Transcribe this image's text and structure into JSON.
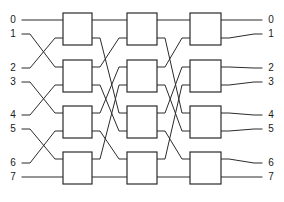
{
  "figure": {
    "type": "diagram",
    "background_color": "#ffffff",
    "line_color": "#2b2b2b",
    "box_fill_color": "#ffffff",
    "label_color": "#1a1a1a"
  },
  "inputs": {
    "labels": [
      "0",
      "1",
      "2",
      "3",
      "4",
      "5",
      "6",
      "7"
    ],
    "label_x": 13,
    "y": [
      20,
      34,
      68,
      82,
      115,
      129,
      163,
      177
    ]
  },
  "outputs": {
    "labels": [
      "0",
      "1",
      "2",
      "3",
      "4",
      "5",
      "6",
      "7"
    ],
    "label_x": 271,
    "y": [
      20,
      34,
      68,
      82,
      115,
      129,
      163,
      177
    ]
  },
  "stages": [
    {
      "name": "stage-1",
      "x": 63,
      "width": 29,
      "boxes": [
        {
          "name": "switch-1-1",
          "y": 13,
          "height": 32
        },
        {
          "name": "switch-1-2",
          "y": 60,
          "height": 32
        },
        {
          "name": "switch-1-3",
          "y": 106,
          "height": 32
        },
        {
          "name": "switch-1-4",
          "y": 152,
          "height": 32
        }
      ]
    },
    {
      "name": "stage-2",
      "x": 127,
      "width": 30,
      "boxes": [
        {
          "name": "switch-2-1",
          "y": 13,
          "height": 32
        },
        {
          "name": "switch-2-2",
          "y": 60,
          "height": 32
        },
        {
          "name": "switch-2-3",
          "y": 106,
          "height": 32
        },
        {
          "name": "switch-2-4",
          "y": 152,
          "height": 32
        }
      ]
    },
    {
      "name": "stage-3",
      "x": 190,
      "width": 31,
      "boxes": [
        {
          "name": "switch-3-1",
          "y": 13,
          "height": 32
        },
        {
          "name": "switch-3-2",
          "y": 60,
          "height": 32
        },
        {
          "name": "switch-3-3",
          "y": 106,
          "height": 32
        },
        {
          "name": "switch-3-4",
          "y": 152,
          "height": 32
        }
      ]
    }
  ],
  "geometry": {
    "port_offsets": [
      7,
      25
    ],
    "input_line_start_x": 22,
    "output_line_end_x": 262
  },
  "wiring": {
    "input_to_stage1": [
      {
        "from": 0,
        "to_box": 0,
        "to_port": 0
      },
      {
        "from": 1,
        "to_box": 1,
        "to_port": 0
      },
      {
        "from": 2,
        "to_box": 0,
        "to_port": 1
      },
      {
        "from": 3,
        "to_box": 2,
        "to_port": 0
      },
      {
        "from": 4,
        "to_box": 1,
        "to_port": 1
      },
      {
        "from": 5,
        "to_box": 3,
        "to_port": 0
      },
      {
        "from": 6,
        "to_box": 2,
        "to_port": 1
      },
      {
        "from": 7,
        "to_box": 3,
        "to_port": 1
      }
    ],
    "stage1_to_stage2": [
      {
        "from_box": 0,
        "from_port": 0,
        "to_box": 0,
        "to_port": 0
      },
      {
        "from_box": 0,
        "from_port": 1,
        "to_box": 2,
        "to_port": 0
      },
      {
        "from_box": 1,
        "from_port": 0,
        "to_box": 0,
        "to_port": 1
      },
      {
        "from_box": 1,
        "from_port": 1,
        "to_box": 2,
        "to_port": 1
      },
      {
        "from_box": 2,
        "from_port": 0,
        "to_box": 1,
        "to_port": 0
      },
      {
        "from_box": 2,
        "from_port": 1,
        "to_box": 3,
        "to_port": 0
      },
      {
        "from_box": 3,
        "from_port": 0,
        "to_box": 1,
        "to_port": 1
      },
      {
        "from_box": 3,
        "from_port": 1,
        "to_box": 3,
        "to_port": 1
      }
    ],
    "stage2_to_stage3": [
      {
        "from_box": 0,
        "from_port": 0,
        "to_box": 0,
        "to_port": 0
      },
      {
        "from_box": 0,
        "from_port": 1,
        "to_box": 2,
        "to_port": 0
      },
      {
        "from_box": 1,
        "from_port": 0,
        "to_box": 0,
        "to_port": 1
      },
      {
        "from_box": 1,
        "from_port": 1,
        "to_box": 2,
        "to_port": 1
      },
      {
        "from_box": 2,
        "from_port": 0,
        "to_box": 1,
        "to_port": 0
      },
      {
        "from_box": 2,
        "from_port": 1,
        "to_box": 3,
        "to_port": 0
      },
      {
        "from_box": 3,
        "from_port": 0,
        "to_box": 1,
        "to_port": 1
      },
      {
        "from_box": 3,
        "from_port": 1,
        "to_box": 3,
        "to_port": 1
      }
    ],
    "stage3_to_output": [
      {
        "from_box": 0,
        "from_port": 0,
        "to": 0
      },
      {
        "from_box": 0,
        "from_port": 1,
        "to": 1
      },
      {
        "from_box": 1,
        "from_port": 0,
        "to": 2
      },
      {
        "from_box": 1,
        "from_port": 1,
        "to": 3
      },
      {
        "from_box": 2,
        "from_port": 0,
        "to": 4
      },
      {
        "from_box": 2,
        "from_port": 1,
        "to": 5
      },
      {
        "from_box": 3,
        "from_port": 0,
        "to": 6
      },
      {
        "from_box": 3,
        "from_port": 1,
        "to": 7
      }
    ]
  }
}
